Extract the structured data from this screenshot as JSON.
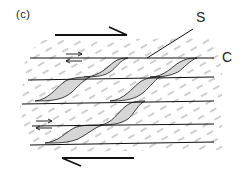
{
  "figure": {
    "panel_label": "(c)",
    "s_label": "S",
    "c_label": "C",
    "colors": {
      "line": "#111111",
      "dash": "#555555",
      "lens_fill": "#d4d4d4",
      "background": "#ffffff"
    },
    "shear_sense": {
      "top_arrow": "dextral, pointing right",
      "bottom_arrow": "pointing left",
      "small_arrows": [
        "half-arrow pair between C1 upper",
        "half-arrow pair at C4 left"
      ]
    },
    "c_planes_count": 5,
    "lenses_count": 8
  }
}
